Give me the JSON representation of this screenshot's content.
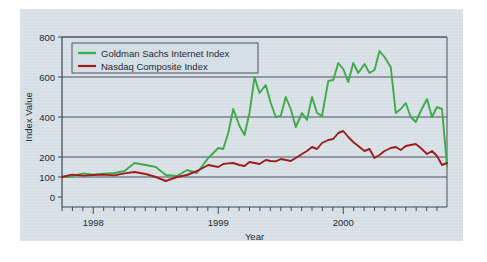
{
  "figure": {
    "background_color": "#ffffff",
    "panel_color": "#d6dee5",
    "frame_color": "#4a5560"
  },
  "chart_data": {
    "type": "line",
    "title": "",
    "xlabel": "Year",
    "ylabel": "Index Value",
    "ylim": [
      0,
      800
    ],
    "yticks": [
      0,
      100,
      200,
      400,
      600,
      800
    ],
    "ytick_labels": [
      "0",
      "100",
      "200",
      "400",
      "600",
      "800"
    ],
    "xlim": [
      1997.75,
      2000.83
    ],
    "xticks": [
      1998,
      1999,
      2000
    ],
    "xtick_labels": [
      "1998",
      "1999",
      "2000"
    ],
    "minor_tick_interval_months": 1,
    "grid": "horizontal",
    "legend_position": "upper-left-inside",
    "series": [
      {
        "name": "Goldman Sachs Internet Index",
        "color": "#3faa4a",
        "x": [
          1997.75,
          1997.83,
          1997.92,
          1998.0,
          1998.08,
          1998.17,
          1998.25,
          1998.33,
          1998.42,
          1998.5,
          1998.58,
          1998.67,
          1998.75,
          1998.83,
          1998.92,
          1999.0,
          1999.04,
          1999.08,
          1999.12,
          1999.17,
          1999.21,
          1999.25,
          1999.29,
          1999.33,
          1999.38,
          1999.42,
          1999.46,
          1999.5,
          1999.54,
          1999.58,
          1999.62,
          1999.67,
          1999.71,
          1999.75,
          1999.79,
          1999.83,
          1999.88,
          1999.92,
          1999.96,
          2000.0,
          2000.04,
          2000.08,
          2000.12,
          2000.17,
          2000.21,
          2000.25,
          2000.29,
          2000.33,
          2000.38,
          2000.42,
          2000.46,
          2000.5,
          2000.54,
          2000.58,
          2000.62,
          2000.67,
          2000.71,
          2000.75,
          2000.79,
          2000.83
        ],
        "y": [
          100,
          104,
          118,
          112,
          116,
          120,
          130,
          170,
          160,
          150,
          110,
          105,
          135,
          120,
          195,
          245,
          240,
          320,
          440,
          355,
          310,
          420,
          600,
          520,
          560,
          470,
          400,
          405,
          500,
          440,
          350,
          420,
          385,
          500,
          420,
          405,
          580,
          585,
          670,
          640,
          575,
          670,
          620,
          665,
          620,
          635,
          730,
          700,
          650,
          420,
          440,
          470,
          400,
          375,
          430,
          490,
          400,
          450,
          440,
          155
        ],
        "notes": "Goldman Sachs Internet Index, indexed to 100 at start"
      },
      {
        "name": "Nasdaq Composite Index",
        "color": "#9e1b1e",
        "x": [
          1997.75,
          1997.83,
          1997.92,
          1998.0,
          1998.08,
          1998.17,
          1998.25,
          1998.33,
          1998.42,
          1998.5,
          1998.58,
          1998.67,
          1998.75,
          1998.83,
          1998.92,
          1999.0,
          1999.04,
          1999.08,
          1999.12,
          1999.17,
          1999.21,
          1999.25,
          1999.29,
          1999.33,
          1999.38,
          1999.42,
          1999.46,
          1999.5,
          1999.54,
          1999.58,
          1999.62,
          1999.67,
          1999.71,
          1999.75,
          1999.79,
          1999.83,
          1999.88,
          1999.92,
          1999.96,
          2000.0,
          2000.04,
          2000.08,
          2000.12,
          2000.17,
          2000.21,
          2000.25,
          2000.29,
          2000.33,
          2000.38,
          2000.42,
          2000.46,
          2000.5,
          2000.54,
          2000.58,
          2000.62,
          2000.67,
          2000.71,
          2000.75,
          2000.79,
          2000.83
        ],
        "y": [
          100,
          112,
          107,
          110,
          112,
          108,
          118,
          125,
          115,
          100,
          80,
          100,
          110,
          130,
          160,
          150,
          165,
          168,
          170,
          160,
          155,
          175,
          170,
          165,
          185,
          180,
          178,
          190,
          185,
          180,
          195,
          215,
          230,
          250,
          240,
          270,
          285,
          290,
          320,
          330,
          300,
          275,
          255,
          230,
          240,
          195,
          210,
          230,
          245,
          250,
          235,
          255,
          260,
          265,
          245,
          215,
          230,
          205,
          160,
          170
        ],
        "notes": "Nasdaq Composite Index, indexed to 100 at start"
      }
    ]
  },
  "legend": {
    "items": [
      {
        "label": "Goldman Sachs Internet Index",
        "color": "#3faa4a"
      },
      {
        "label": "Nasdaq Composite Index",
        "color": "#9e1b1e"
      }
    ]
  }
}
